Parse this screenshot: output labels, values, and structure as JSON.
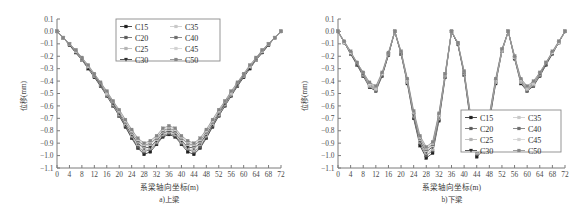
{
  "figure": {
    "panels": [
      {
        "id": "upper-beam",
        "caption": "a)上梁",
        "xlabel": "系梁轴向坐标(m)",
        "ylabel": "位移(mm)",
        "legend_position": "top-center"
      },
      {
        "id": "lower-beam",
        "caption": "b)下梁",
        "xlabel": "系梁轴向坐标(m)",
        "ylabel": "位移(mm)",
        "legend_position": "bottom-right"
      }
    ],
    "legend_labels": [
      "C15",
      "C20",
      "C25",
      "C30",
      "C35",
      "C40",
      "C45",
      "C50"
    ],
    "series_colors": [
      "#1f1f1f",
      "#5c5c5c",
      "#b4b4b4",
      "#2e2e2e",
      "#c8c8c8",
      "#6e6e6e",
      "#d2d2d2",
      "#858585"
    ],
    "markers": [
      "square",
      "square",
      "square",
      "triangle-down",
      "square",
      "square",
      "square",
      "square"
    ]
  },
  "chart_data": [
    {
      "type": "line",
      "title": "a)上梁",
      "xlabel": "系梁轴向坐标(m)",
      "ylabel": "位移(mm)",
      "xlim": [
        0,
        72
      ],
      "ylim": [
        -1.1,
        0.1
      ],
      "xticks": [
        0,
        4,
        8,
        12,
        16,
        20,
        24,
        28,
        32,
        36,
        40,
        44,
        48,
        52,
        56,
        60,
        64,
        68,
        72
      ],
      "yticks": [
        0.1,
        0.0,
        -0.1,
        -0.2,
        -0.3,
        -0.4,
        -0.5,
        -0.6,
        -0.7,
        -0.8,
        -0.9,
        -1.0,
        -1.1
      ],
      "grid": false,
      "legend": [
        "C15",
        "C20",
        "C25",
        "C30",
        "C35",
        "C40",
        "C45",
        "C50"
      ],
      "x": [
        0,
        2,
        4,
        6,
        8,
        10,
        12,
        14,
        16,
        18,
        20,
        22,
        24,
        26,
        28,
        30,
        32,
        34,
        36,
        38,
        40,
        42,
        44,
        46,
        48,
        50,
        52,
        54,
        56,
        58,
        60,
        62,
        64,
        66,
        68,
        70,
        72
      ],
      "series": [
        {
          "name": "C15",
          "values": [
            0.0,
            -0.05,
            -0.11,
            -0.17,
            -0.23,
            -0.3,
            -0.37,
            -0.44,
            -0.52,
            -0.6,
            -0.68,
            -0.77,
            -0.86,
            -0.94,
            -0.99,
            -0.97,
            -0.91,
            -0.85,
            -0.83,
            -0.85,
            -0.91,
            -0.97,
            -0.99,
            -0.94,
            -0.86,
            -0.77,
            -0.68,
            -0.6,
            -0.52,
            -0.44,
            -0.37,
            -0.3,
            -0.23,
            -0.17,
            -0.11,
            -0.05,
            0.0
          ]
        },
        {
          "name": "C20",
          "values": [
            0.0,
            -0.05,
            -0.11,
            -0.17,
            -0.23,
            -0.29,
            -0.36,
            -0.44,
            -0.51,
            -0.59,
            -0.68,
            -0.76,
            -0.85,
            -0.93,
            -0.97,
            -0.95,
            -0.9,
            -0.84,
            -0.82,
            -0.84,
            -0.9,
            -0.95,
            -0.97,
            -0.93,
            -0.85,
            -0.76,
            -0.68,
            -0.59,
            -0.51,
            -0.44,
            -0.36,
            -0.29,
            -0.23,
            -0.17,
            -0.11,
            -0.05,
            0.0
          ]
        },
        {
          "name": "C25",
          "values": [
            0.0,
            -0.05,
            -0.1,
            -0.16,
            -0.23,
            -0.29,
            -0.36,
            -0.43,
            -0.51,
            -0.59,
            -0.67,
            -0.75,
            -0.84,
            -0.91,
            -0.96,
            -0.94,
            -0.89,
            -0.83,
            -0.81,
            -0.83,
            -0.89,
            -0.94,
            -0.96,
            -0.91,
            -0.84,
            -0.75,
            -0.67,
            -0.59,
            -0.51,
            -0.43,
            -0.36,
            -0.29,
            -0.23,
            -0.16,
            -0.1,
            -0.05,
            0.0
          ]
        },
        {
          "name": "C30",
          "values": [
            0.0,
            -0.05,
            -0.1,
            -0.16,
            -0.22,
            -0.29,
            -0.35,
            -0.43,
            -0.5,
            -0.58,
            -0.66,
            -0.75,
            -0.83,
            -0.9,
            -0.94,
            -0.93,
            -0.88,
            -0.82,
            -0.8,
            -0.82,
            -0.88,
            -0.93,
            -0.94,
            -0.9,
            -0.83,
            -0.75,
            -0.66,
            -0.58,
            -0.5,
            -0.43,
            -0.35,
            -0.29,
            -0.22,
            -0.16,
            -0.1,
            -0.05,
            0.0
          ]
        },
        {
          "name": "C35",
          "values": [
            0.0,
            -0.05,
            -0.1,
            -0.16,
            -0.22,
            -0.28,
            -0.35,
            -0.42,
            -0.5,
            -0.57,
            -0.65,
            -0.74,
            -0.82,
            -0.89,
            -0.93,
            -0.91,
            -0.87,
            -0.81,
            -0.79,
            -0.81,
            -0.87,
            -0.91,
            -0.93,
            -0.89,
            -0.82,
            -0.74,
            -0.65,
            -0.57,
            -0.5,
            -0.42,
            -0.35,
            -0.28,
            -0.22,
            -0.16,
            -0.1,
            -0.05,
            0.0
          ]
        },
        {
          "name": "C40",
          "values": [
            0.0,
            -0.05,
            -0.1,
            -0.15,
            -0.22,
            -0.28,
            -0.35,
            -0.42,
            -0.49,
            -0.57,
            -0.65,
            -0.73,
            -0.81,
            -0.88,
            -0.92,
            -0.9,
            -0.86,
            -0.8,
            -0.78,
            -0.8,
            -0.86,
            -0.9,
            -0.92,
            -0.88,
            -0.81,
            -0.73,
            -0.65,
            -0.57,
            -0.49,
            -0.42,
            -0.35,
            -0.28,
            -0.22,
            -0.15,
            -0.1,
            -0.05,
            0.0
          ]
        },
        {
          "name": "C45",
          "values": [
            0.0,
            -0.05,
            -0.1,
            -0.15,
            -0.21,
            -0.28,
            -0.34,
            -0.41,
            -0.49,
            -0.56,
            -0.64,
            -0.72,
            -0.8,
            -0.87,
            -0.91,
            -0.89,
            -0.85,
            -0.79,
            -0.77,
            -0.79,
            -0.85,
            -0.89,
            -0.91,
            -0.87,
            -0.8,
            -0.72,
            -0.64,
            -0.56,
            -0.49,
            -0.41,
            -0.34,
            -0.28,
            -0.21,
            -0.15,
            -0.1,
            -0.05,
            0.0
          ]
        },
        {
          "name": "C50",
          "values": [
            0.0,
            -0.05,
            -0.1,
            -0.15,
            -0.21,
            -0.27,
            -0.34,
            -0.41,
            -0.48,
            -0.56,
            -0.63,
            -0.71,
            -0.79,
            -0.86,
            -0.9,
            -0.88,
            -0.84,
            -0.78,
            -0.76,
            -0.78,
            -0.84,
            -0.88,
            -0.9,
            -0.86,
            -0.79,
            -0.71,
            -0.63,
            -0.56,
            -0.48,
            -0.41,
            -0.34,
            -0.27,
            -0.21,
            -0.15,
            -0.1,
            -0.05,
            0.0
          ]
        }
      ]
    },
    {
      "type": "line",
      "title": "b)下梁",
      "xlabel": "系梁轴向坐标(m)",
      "ylabel": "位移(mm)",
      "xlim": [
        0,
        72
      ],
      "ylim": [
        -1.1,
        0.1
      ],
      "xticks": [
        0,
        4,
        8,
        12,
        16,
        20,
        24,
        28,
        32,
        36,
        40,
        44,
        48,
        52,
        56,
        60,
        64,
        68,
        72
      ],
      "yticks": [
        0.1,
        0.0,
        -0.1,
        -0.2,
        -0.3,
        -0.4,
        -0.5,
        -0.6,
        -0.7,
        -0.8,
        -0.9,
        -1.0,
        -1.1
      ],
      "grid": false,
      "legend": [
        "C15",
        "C20",
        "C25",
        "C30",
        "C35",
        "C40",
        "C45",
        "C50"
      ],
      "x": [
        0,
        2,
        4,
        6,
        8,
        10,
        12,
        14,
        16,
        18,
        20,
        22,
        24,
        26,
        28,
        30,
        32,
        34,
        36,
        38,
        40,
        42,
        44,
        46,
        48,
        50,
        52,
        54,
        56,
        58,
        60,
        62,
        64,
        66,
        68,
        70,
        72
      ],
      "series": [
        {
          "name": "C15",
          "values": [
            0.0,
            -0.09,
            -0.18,
            -0.27,
            -0.36,
            -0.45,
            -0.48,
            -0.36,
            -0.19,
            0.0,
            -0.18,
            -0.42,
            -0.7,
            -0.92,
            -1.02,
            -0.98,
            -0.72,
            -0.37,
            0.0,
            -0.1,
            -0.35,
            -0.72,
            -1.01,
            -0.96,
            -0.73,
            -0.42,
            -0.16,
            0.0,
            -0.22,
            -0.42,
            -0.48,
            -0.44,
            -0.36,
            -0.27,
            -0.18,
            -0.09,
            0.0
          ]
        },
        {
          "name": "C20",
          "values": [
            0.0,
            -0.09,
            -0.18,
            -0.26,
            -0.35,
            -0.44,
            -0.47,
            -0.35,
            -0.19,
            0.0,
            -0.18,
            -0.41,
            -0.69,
            -0.9,
            -1.0,
            -0.96,
            -0.71,
            -0.36,
            0.0,
            -0.1,
            -0.34,
            -0.71,
            -0.99,
            -0.94,
            -0.72,
            -0.41,
            -0.16,
            0.0,
            -0.21,
            -0.41,
            -0.47,
            -0.43,
            -0.35,
            -0.26,
            -0.18,
            -0.09,
            0.0
          ]
        },
        {
          "name": "C25",
          "values": [
            0.0,
            -0.09,
            -0.17,
            -0.26,
            -0.35,
            -0.44,
            -0.47,
            -0.35,
            -0.18,
            0.0,
            -0.17,
            -0.41,
            -0.68,
            -0.89,
            -0.98,
            -0.95,
            -0.7,
            -0.36,
            0.0,
            -0.1,
            -0.34,
            -0.7,
            -0.98,
            -0.93,
            -0.71,
            -0.41,
            -0.16,
            0.0,
            -0.21,
            -0.41,
            -0.47,
            -0.43,
            -0.35,
            -0.26,
            -0.17,
            -0.09,
            0.0
          ]
        },
        {
          "name": "C30",
          "values": [
            0.0,
            -0.09,
            -0.17,
            -0.26,
            -0.34,
            -0.43,
            -0.46,
            -0.35,
            -0.18,
            0.0,
            -0.17,
            -0.4,
            -0.67,
            -0.88,
            -0.97,
            -0.93,
            -0.69,
            -0.35,
            0.0,
            -0.1,
            -0.33,
            -0.69,
            -0.96,
            -0.92,
            -0.7,
            -0.4,
            -0.15,
            0.0,
            -0.21,
            -0.4,
            -0.46,
            -0.42,
            -0.34,
            -0.26,
            -0.17,
            -0.09,
            0.0
          ]
        },
        {
          "name": "C35",
          "values": [
            0.0,
            -0.09,
            -0.17,
            -0.25,
            -0.34,
            -0.43,
            -0.46,
            -0.34,
            -0.18,
            0.0,
            -0.17,
            -0.4,
            -0.66,
            -0.87,
            -0.96,
            -0.92,
            -0.68,
            -0.35,
            0.0,
            -0.09,
            -0.33,
            -0.68,
            -0.95,
            -0.91,
            -0.69,
            -0.4,
            -0.15,
            0.0,
            -0.21,
            -0.4,
            -0.46,
            -0.42,
            -0.34,
            -0.25,
            -0.17,
            -0.09,
            0.0
          ]
        },
        {
          "name": "C40",
          "values": [
            0.0,
            -0.08,
            -0.17,
            -0.25,
            -0.34,
            -0.42,
            -0.45,
            -0.34,
            -0.18,
            0.0,
            -0.17,
            -0.39,
            -0.66,
            -0.86,
            -0.95,
            -0.91,
            -0.67,
            -0.34,
            0.0,
            -0.09,
            -0.33,
            -0.67,
            -0.94,
            -0.9,
            -0.68,
            -0.39,
            -0.15,
            0.0,
            -0.2,
            -0.39,
            -0.45,
            -0.41,
            -0.34,
            -0.25,
            -0.17,
            -0.08,
            0.0
          ]
        },
        {
          "name": "C45",
          "values": [
            0.0,
            -0.08,
            -0.17,
            -0.25,
            -0.33,
            -0.42,
            -0.45,
            -0.34,
            -0.17,
            0.0,
            -0.16,
            -0.39,
            -0.65,
            -0.85,
            -0.94,
            -0.9,
            -0.67,
            -0.34,
            0.0,
            -0.09,
            -0.32,
            -0.67,
            -0.93,
            -0.89,
            -0.68,
            -0.39,
            -0.15,
            0.0,
            -0.2,
            -0.39,
            -0.45,
            -0.41,
            -0.33,
            -0.25,
            -0.17,
            -0.08,
            0.0
          ]
        },
        {
          "name": "C50",
          "values": [
            0.0,
            -0.08,
            -0.16,
            -0.25,
            -0.33,
            -0.41,
            -0.44,
            -0.33,
            -0.17,
            0.0,
            -0.16,
            -0.38,
            -0.64,
            -0.84,
            -0.93,
            -0.89,
            -0.66,
            -0.34,
            0.0,
            -0.09,
            -0.32,
            -0.66,
            -0.92,
            -0.88,
            -0.67,
            -0.38,
            -0.14,
            0.0,
            -0.2,
            -0.38,
            -0.44,
            -0.4,
            -0.33,
            -0.25,
            -0.16,
            -0.08,
            0.0
          ]
        }
      ]
    }
  ]
}
